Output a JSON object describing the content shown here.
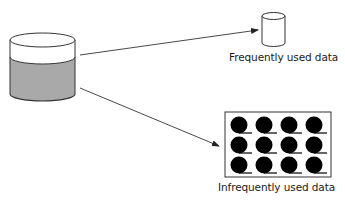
{
  "diagram": {
    "title": "",
    "source": {
      "name": "primary-storage",
      "shape": "cylinder",
      "fill_color": "#a9a9a9",
      "top_color": "#ffffff"
    },
    "targets": [
      {
        "name": "frequently-used",
        "label": "Frequently used data",
        "shape": "small-cylinder"
      },
      {
        "name": "infrequently-used",
        "label": "Infrequently used data",
        "shape": "tape-library",
        "reels": {
          "rows": 3,
          "cols": 4
        }
      }
    ],
    "arrows": [
      {
        "from": "primary-storage",
        "to": "frequently-used"
      },
      {
        "from": "primary-storage",
        "to": "infrequently-used"
      }
    ],
    "colors": {
      "stroke": "#333333",
      "reel": "#000000",
      "background": "#ffffff"
    }
  }
}
